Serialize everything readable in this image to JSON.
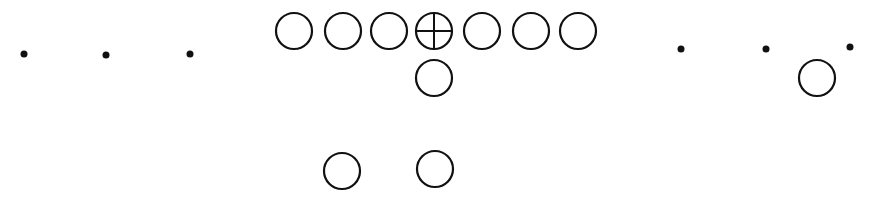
{
  "diagram": {
    "type": "football-formation",
    "width": 875,
    "height": 199,
    "stroke_color": "#111111",
    "background": "#ffffff",
    "offense": [
      {
        "role": "left-tackle",
        "x": 294,
        "y": 31,
        "r": 18,
        "center_mark": false
      },
      {
        "role": "left-guard",
        "x": 343,
        "y": 31,
        "r": 18,
        "center_mark": false
      },
      {
        "role": "left-guard-inner",
        "x": 389,
        "y": 31,
        "r": 18,
        "center_mark": false
      },
      {
        "role": "center",
        "x": 434,
        "y": 31,
        "r": 18,
        "center_mark": true
      },
      {
        "role": "right-guard",
        "x": 482,
        "y": 31,
        "r": 18,
        "center_mark": false
      },
      {
        "role": "right-tackle",
        "x": 531,
        "y": 31,
        "r": 18,
        "center_mark": false
      },
      {
        "role": "tight-end",
        "x": 578,
        "y": 31,
        "r": 18,
        "center_mark": false
      },
      {
        "role": "quarterback",
        "x": 434,
        "y": 78,
        "r": 18,
        "center_mark": false
      },
      {
        "role": "wingback",
        "x": 817,
        "y": 78,
        "r": 18,
        "center_mark": false
      },
      {
        "role": "halfback",
        "x": 342,
        "y": 171,
        "r": 18,
        "center_mark": false
      },
      {
        "role": "fullback",
        "x": 435,
        "y": 169,
        "r": 18,
        "center_mark": false
      }
    ],
    "markers": [
      {
        "x": 24,
        "y": 54,
        "r": 3.5
      },
      {
        "x": 106,
        "y": 55,
        "r": 3.5
      },
      {
        "x": 190,
        "y": 54,
        "r": 3.5
      },
      {
        "x": 681,
        "y": 49,
        "r": 3.5
      },
      {
        "x": 766,
        "y": 49,
        "r": 3.5
      },
      {
        "x": 850,
        "y": 47,
        "r": 3.5
      }
    ]
  }
}
